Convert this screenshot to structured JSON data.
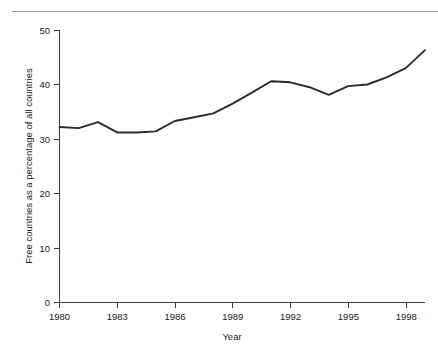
{
  "chart_data": {
    "type": "line",
    "title": "",
    "xlabel": "Year",
    "ylabel": "Free countries as a percentage of all countries",
    "x": [
      1980,
      1981,
      1982,
      1983,
      1984,
      1985,
      1986,
      1987,
      1988,
      1989,
      1990,
      1991,
      1992,
      1993,
      1994,
      1995,
      1996,
      1997,
      1998,
      1999
    ],
    "values": [
      32.2,
      32.0,
      33.1,
      31.2,
      31.2,
      31.4,
      33.3,
      34.0,
      34.7,
      36.5,
      38.5,
      40.6,
      40.4,
      39.5,
      38.1,
      39.7,
      40.0,
      41.3,
      43.0,
      46.3
    ],
    "series": [
      {
        "name": "Free countries as a percentage of all countries",
        "values": [
          32.2,
          32.0,
          33.1,
          31.2,
          31.2,
          31.4,
          33.3,
          34.0,
          34.7,
          36.5,
          38.5,
          40.6,
          40.4,
          39.5,
          38.1,
          39.7,
          40.0,
          41.3,
          43.0,
          46.3
        ]
      }
    ],
    "xlim": [
      1980,
      1999
    ],
    "ylim": [
      0,
      50
    ],
    "xticks": [
      1980,
      1983,
      1986,
      1989,
      1992,
      1995,
      1998
    ],
    "xtick_labels": [
      "1980",
      "1983",
      "1986",
      "1989",
      "1992",
      "1995",
      "1998"
    ],
    "yticks": [
      0,
      10,
      20,
      30,
      40,
      50
    ],
    "ytick_labels": [
      "0",
      "10",
      "20",
      "30",
      "40",
      "50"
    ],
    "grid": false,
    "legend": false,
    "legend_position": "none",
    "line_color": "#2b2b2b",
    "axis_color": "#3d3d3d",
    "background_color": "#ffffff"
  },
  "figure": {
    "top_rule_color": "#9a9a9a"
  }
}
